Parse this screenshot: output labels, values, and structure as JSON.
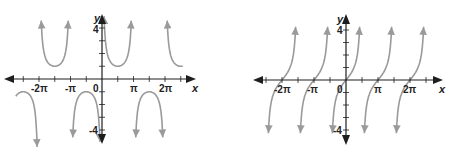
{
  "chart_data": [
    {
      "type": "line",
      "title": "",
      "function": "y = csc x",
      "xlabel": "x",
      "ylabel": "y",
      "x_tick_labels": [
        "-2π",
        "-π",
        "0",
        "π",
        "2π"
      ],
      "x_tick_values": [
        -6.2832,
        -3.1416,
        0,
        3.1416,
        6.2832
      ],
      "y_tick_labels": [
        "4",
        "-4"
      ],
      "y_tick_values": [
        4,
        -4
      ],
      "xlim": [
        -3.5,
        7.5
      ],
      "ylim": [
        -4.5,
        4.5
      ],
      "grid": false,
      "asymptotes": [
        -6.2832,
        -3.1416,
        0,
        3.1416,
        6.2832
      ],
      "branches": [
        {
          "x_range": [
            -7.6,
            -6.47
          ],
          "shape": "down-arc"
        },
        {
          "x_range": [
            -6.09,
            -3.33
          ],
          "shape": "U",
          "min": [
            -4.7124,
            1
          ]
        },
        {
          "x_range": [
            -2.95,
            -0.2
          ],
          "shape": "cap",
          "max": [
            -1.5708,
            -1
          ]
        },
        {
          "x_range": [
            0.2,
            2.95
          ],
          "shape": "U",
          "min": [
            1.5708,
            1
          ]
        },
        {
          "x_range": [
            3.33,
            6.09
          ],
          "shape": "cap",
          "max": [
            4.7124,
            -1
          ]
        },
        {
          "x_range": [
            6.47,
            7.6
          ],
          "shape": "up-arc"
        }
      ],
      "series": [
        {
          "name": "csc x",
          "color": "#9a9a9a"
        }
      ]
    },
    {
      "type": "line",
      "title": "",
      "function": "y = tan x (period π, zeros at kπ)",
      "xlabel": "x",
      "ylabel": "y",
      "x_tick_labels": [
        "-2π",
        "-π",
        "0",
        "π",
        "2π"
      ],
      "x_tick_values": [
        -6.2832,
        -3.1416,
        0,
        3.1416,
        6.2832
      ],
      "y_tick_labels": [
        "4",
        "-4"
      ],
      "y_tick_values": [
        4,
        -4
      ],
      "grid": false,
      "zeros": [
        -6.2832,
        -3.1416,
        0,
        3.1416,
        6.2832
      ],
      "series": [
        {
          "name": "tan x",
          "color": "#9a9a9a"
        }
      ]
    }
  ],
  "left": {
    "labels": {
      "x": "x",
      "y": "y",
      "t_m2pi": "-2π",
      "t_mpi": "-π",
      "t_0": "0",
      "t_pi": "π",
      "t_2pi": "2π",
      "y4": "4",
      "ym4": "-4"
    }
  },
  "right": {
    "labels": {
      "x": "x",
      "y": "y",
      "t_m2pi": "-2π",
      "t_mpi": "-π",
      "t_0": "0",
      "t_pi": "π",
      "t_2pi": "2π",
      "y4": "4",
      "ym4": "-4"
    }
  }
}
